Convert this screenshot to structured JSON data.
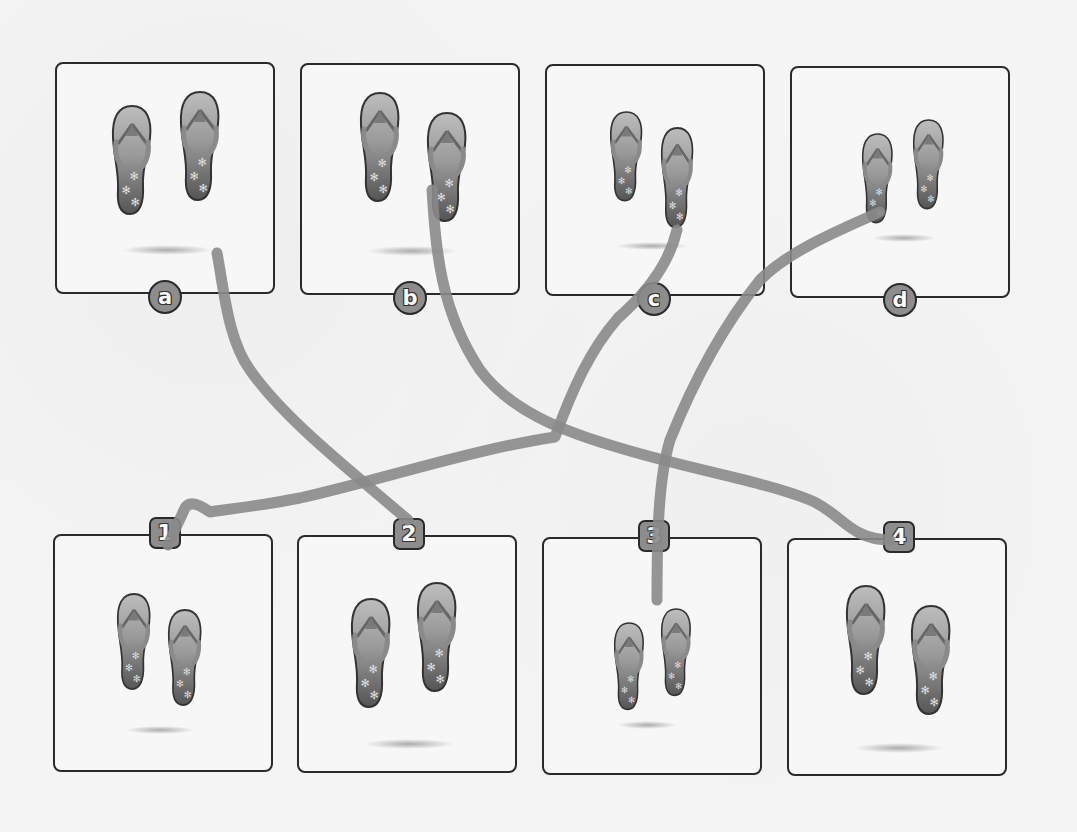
{
  "worksheet": {
    "type": "matching activity",
    "top_row": [
      {
        "label": "a",
        "item": "flip-flops",
        "size": "large"
      },
      {
        "label": "b",
        "item": "flip-flops",
        "size": "large"
      },
      {
        "label": "c",
        "item": "flip-flops",
        "size": "medium"
      },
      {
        "label": "d",
        "item": "flip-flops",
        "size": "small"
      }
    ],
    "bottom_row": [
      {
        "label": "1",
        "item": "flip-flops",
        "size": "medium"
      },
      {
        "label": "2",
        "item": "flip-flops",
        "size": "large"
      },
      {
        "label": "3",
        "item": "flip-flops",
        "size": "small"
      },
      {
        "label": "4",
        "item": "flip-flops",
        "size": "large"
      }
    ],
    "drawn_matches": [
      {
        "from": "a",
        "to": "2"
      },
      {
        "from": "b",
        "to": "4"
      },
      {
        "from": "c",
        "to": "1"
      },
      {
        "from": "d",
        "to": "3"
      }
    ],
    "colors": {
      "line": "#8a8a8a",
      "border": "#2a2a2a",
      "badge": "#8d8d8d",
      "sandal_top": "#b8b8b8",
      "sandal_bottom": "#5a5a5a"
    }
  }
}
